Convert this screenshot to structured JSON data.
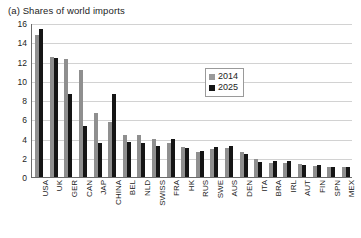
{
  "panel": {
    "title": "(a) Shares of world imports"
  },
  "legend": {
    "position": "inside-top-right",
    "entries": [
      {
        "label": "2014",
        "color": "#9a9a9a"
      },
      {
        "label": "2025",
        "color": "#151515"
      }
    ]
  },
  "axis": {
    "y_ticks": [
      "16",
      "14",
      "12",
      "10",
      "8",
      "6",
      "4",
      "2",
      "0"
    ],
    "y_min": 0,
    "y_max": 16,
    "y_step": 2
  },
  "chart_data": {
    "type": "bar",
    "title": "(a) Shares of world imports",
    "xlabel": "",
    "ylabel": "",
    "ylim": [
      0,
      16
    ],
    "grid": true,
    "legend_position": "inside-top-right",
    "categories": [
      "USA",
      "UK",
      "GER",
      "CAN",
      "JAP",
      "CHINA",
      "BEL",
      "NLD",
      "SWISS",
      "FRA",
      "HK",
      "RUS",
      "SWE",
      "AUS",
      "DEN",
      "ITA",
      "BRA",
      "IRL",
      "AUT",
      "FIN",
      "SPN",
      "MEX"
    ],
    "series": [
      {
        "name": "2014",
        "color": "#9a9a9a",
        "values": [
          14.8,
          12.5,
          12.3,
          11.1,
          6.7,
          5.7,
          4.4,
          4.4,
          4.0,
          3.5,
          3.1,
          2.6,
          2.9,
          3.0,
          2.6,
          1.9,
          1.5,
          1.5,
          1.4,
          1.1,
          1.0,
          1.0
        ]
      },
      {
        "name": "2025",
        "color": "#151515",
        "values": [
          15.4,
          12.4,
          8.6,
          5.3,
          3.5,
          8.6,
          3.6,
          3.5,
          3.2,
          3.9,
          3.0,
          2.7,
          3.1,
          3.2,
          2.4,
          1.6,
          1.7,
          1.7,
          1.3,
          1.2,
          1.0,
          1.0
        ]
      }
    ]
  }
}
